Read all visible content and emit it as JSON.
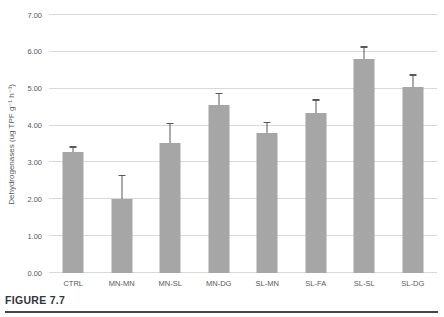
{
  "figure": {
    "caption": "FIGURE 7.7"
  },
  "chart_data": {
    "type": "bar",
    "title": "",
    "xlabel": "",
    "ylabel": "Dehydrogenases (ug TPF g⁻¹ h⁻¹)",
    "ylim": [
      0,
      7
    ],
    "ytick_step": 1,
    "ytick_labels": [
      "0.00",
      "1.00",
      "2.00",
      "3.00",
      "4.00",
      "5.00",
      "6.00",
      "7.00"
    ],
    "categories": [
      "CTRL",
      "MN-MN",
      "MN-SL",
      "MN-DG",
      "SL-MN",
      "SL-FA",
      "SL-SL",
      "SL-DG"
    ],
    "values": [
      3.28,
      2.02,
      3.53,
      4.57,
      3.8,
      4.35,
      5.81,
      5.05
    ],
    "errors": [
      0.12,
      0.6,
      0.5,
      0.28,
      0.26,
      0.32,
      0.3,
      0.3
    ],
    "error_direction": "plus",
    "grid": true,
    "legend": false,
    "colors": {
      "bar": "#a6a6a6",
      "error_bar": "#595959",
      "gridline": "#d9d9d9",
      "tick_label": "#595959",
      "caption": "#34343e"
    }
  }
}
